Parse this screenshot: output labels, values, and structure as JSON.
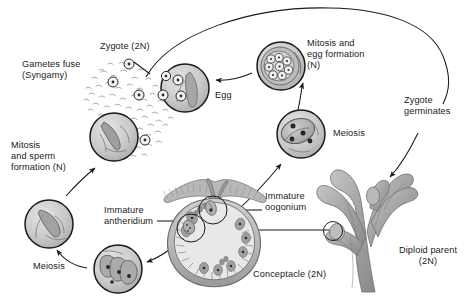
{
  "diagram": {
    "background_color": "#ffffff",
    "ink_color": "#1a1a1a",
    "fill_light": "#d8d8d8",
    "fill_mid": "#b4b4b4",
    "fill_dark": "#8f8f8f"
  },
  "labels": {
    "gametes_fuse": "Gametes fuse\n(Syngamy)",
    "zygote_2n": "Zygote (2N)",
    "mitosis_egg_formation": "Mitosis and\negg formation\n(N)",
    "egg": "Egg",
    "zygote_germinates": "Zygote\ngerminates",
    "meiosis_right": "Meiosis",
    "mitosis_sperm_formation": "Mitosis\nand sperm\nformation (N)",
    "meiosis_left": "Meiosis",
    "immature_antheridium": "Immature\nantheridium",
    "immature_oogonium": "Immature\noogonium",
    "conceptacle_2n": "Conceptacle (2N)",
    "diploid_parent": "Diploid parent\n(2N)"
  },
  "stages": [
    {
      "id": "diploid-parent",
      "name": "Diploid parent (2N)",
      "ploidy": "2N",
      "description": "Branched rockweed thallus with swollen receptacles"
    },
    {
      "id": "conceptacle",
      "name": "Conceptacle (2N)",
      "ploidy": "2N",
      "description": "Flask-shaped cavity with ostiole and paraphyses"
    },
    {
      "id": "immature-oogonium",
      "name": "Immature oogonium",
      "ploidy": "2N",
      "description": "Diploid oogonium lining the conceptacle wall"
    },
    {
      "id": "immature-antheridium",
      "name": "Immature antheridium",
      "ploidy": "2N",
      "description": "Diploid antheridium lining the conceptacle wall"
    },
    {
      "id": "meiosis-oogonium",
      "name": "Meiosis",
      "ploidy": "N",
      "description": "Oogonium after meiosis with four haploid nuclei"
    },
    {
      "id": "egg-formation",
      "name": "Mitosis and egg formation (N)",
      "ploidy": "N",
      "description": "Oogonium containing eight haploid eggs"
    },
    {
      "id": "meiosis-antheridium",
      "name": "Meiosis",
      "ploidy": "N",
      "description": "Antheridium after meiosis with haploid nuclei"
    },
    {
      "id": "sperm-formation",
      "name": "Mitosis and sperm formation (N)",
      "ploidy": "N",
      "description": "Antheridium packed with haploid sperm"
    },
    {
      "id": "syngamy",
      "name": "Gametes fuse (Syngamy)",
      "ploidy": "N + N",
      "description": "Released eggs and swimming sperm in open water"
    },
    {
      "id": "zygote",
      "name": "Zygote (2N)",
      "ploidy": "2N",
      "description": "Fertilized zygote with two nuclei"
    },
    {
      "id": "germination",
      "name": "Zygote germinates",
      "ploidy": "2N",
      "description": "Zygote grows into a new diploid parent"
    }
  ],
  "gamete_field": {
    "egg_count": 6,
    "sperm_count": 70,
    "description": "Scatter of released eggs (ringed circles) among many small sperm"
  },
  "cell_contents": {
    "egg_formation_egg_count": 8,
    "meiosis_oogonium_nuclei": 4,
    "antheridium_nuclei": 3,
    "zygote_nuclei": 2
  },
  "arrows": [
    {
      "from": "diploid-parent",
      "to": "conceptacle",
      "style": "straight-leader"
    },
    {
      "from": "conceptacle-oogonium",
      "to": "meiosis-oogonium",
      "style": "curved"
    },
    {
      "from": "meiosis-oogonium",
      "to": "egg-formation",
      "style": "curved"
    },
    {
      "from": "egg-formation",
      "to": "zygote",
      "style": "curved"
    },
    {
      "from": "conceptacle-antheridium",
      "to": "meiosis-antheridium",
      "style": "curved"
    },
    {
      "from": "meiosis-antheridium",
      "to": "sperm-formation",
      "style": "curved"
    },
    {
      "from": "sperm-formation",
      "to": "syngamy",
      "style": "curved"
    },
    {
      "from": "zygote",
      "to": "germination",
      "style": "long-arc-top"
    },
    {
      "from": "germination",
      "to": "diploid-parent",
      "style": "curved"
    }
  ]
}
